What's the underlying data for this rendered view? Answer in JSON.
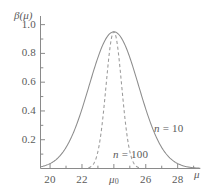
{
  "chart_data": {
    "type": "line",
    "title": "",
    "xlabel": "μ",
    "ylabel": "β(μ)",
    "xlim": [
      19.4,
      29.4
    ],
    "ylim": [
      0.0,
      1.06
    ],
    "grid": false,
    "legend_position": "inline-annotation",
    "x_ticks": [
      20,
      22,
      24,
      26,
      28
    ],
    "x_tick_labels": [
      "20",
      "22",
      "μ₀",
      "26",
      "28"
    ],
    "x_minor_ticks": [
      21,
      23,
      25,
      27,
      29
    ],
    "y_ticks": [
      0.2,
      0.4,
      0.6,
      0.8,
      1.0
    ],
    "y_tick_labels": [
      "0.2",
      "0.4",
      "0.6",
      "0.8",
      "1.0"
    ],
    "y_minor_ticks": [
      0.1,
      0.3,
      0.5,
      0.7,
      0.9
    ],
    "peak_value": 0.95,
    "center": 24,
    "series": [
      {
        "name": "n = 10",
        "label_n": "n",
        "label_eq": "= 10",
        "style": "solid",
        "color": "#8c8c8c",
        "sigma": 1.55,
        "amplitude": 0.95,
        "mean": 24,
        "x": [
          19.4,
          19.8,
          20.0,
          20.4,
          20.8,
          21.2,
          21.6,
          22.0,
          22.4,
          22.8,
          23.2,
          23.6,
          24.0,
          24.4,
          24.8,
          25.2,
          25.6,
          26.0,
          26.4,
          26.8,
          27.2,
          27.6,
          28.0,
          28.4,
          28.8,
          29.2,
          29.4
        ],
        "y": [
          0.015,
          0.031,
          0.042,
          0.072,
          0.118,
          0.182,
          0.265,
          0.361,
          0.465,
          0.568,
          0.7,
          0.82,
          0.95,
          0.82,
          0.7,
          0.568,
          0.465,
          0.361,
          0.265,
          0.182,
          0.118,
          0.072,
          0.042,
          0.023,
          0.012,
          0.006,
          0.004
        ]
      },
      {
        "name": "n = 100",
        "label_n": "n",
        "label_eq": "= 100",
        "style": "dashed",
        "color": "#9a9a9a",
        "sigma": 0.49,
        "amplitude": 0.95,
        "mean": 24,
        "x": [
          22.4,
          22.6,
          22.8,
          23.0,
          23.2,
          23.4,
          23.6,
          23.8,
          24.0,
          24.2,
          24.4,
          24.6,
          24.8,
          25.0,
          25.2,
          25.4,
          25.6
        ],
        "y": [
          0.006,
          0.018,
          0.048,
          0.11,
          0.222,
          0.39,
          0.6,
          0.82,
          0.95,
          0.82,
          0.6,
          0.39,
          0.222,
          0.11,
          0.048,
          0.018,
          0.006
        ]
      }
    ],
    "annotations": [
      {
        "text_n": "n",
        "text_rest": "= 10",
        "x_px": 154,
        "y_px": 122
      },
      {
        "text_n": "n",
        "text_rest": "= 100",
        "x_px": 113,
        "y_px": 148
      }
    ]
  },
  "axis": {
    "y_axis_name": "β(μ)",
    "x_axis_name": "μ",
    "mu_zero_base": "μ",
    "mu_zero_sub": "0"
  },
  "colors": {
    "background": "#ffffff",
    "axis": "#8a8a8a",
    "curve_solid": "#8c8c8c",
    "curve_dashed": "#9a9a9a",
    "text": "#5a5a5a"
  }
}
